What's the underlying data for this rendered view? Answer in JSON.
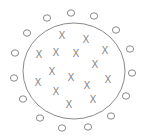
{
  "diagram": {
    "type": "classification-boundary",
    "colors": {
      "stroke": "#8a8a8a",
      "background": "#ffffff"
    },
    "boundary": {
      "shape": "circle",
      "cx": 74,
      "cy": 71,
      "rx": 51,
      "ry": 48
    },
    "inside_marker": "X",
    "outside_marker": "O",
    "x_points": [
      [
        62,
        35
      ],
      [
        86,
        39
      ],
      [
        105,
        50
      ],
      [
        39,
        54
      ],
      [
        56,
        52
      ],
      [
        76,
        53
      ],
      [
        95,
        64
      ],
      [
        52,
        71
      ],
      [
        71,
        77
      ],
      [
        38,
        82
      ],
      [
        87,
        85
      ],
      [
        108,
        79
      ],
      [
        56,
        91
      ],
      [
        93,
        99
      ],
      [
        69,
        104
      ]
    ],
    "o_points": [
      [
        71,
        13
      ],
      [
        94,
        16
      ],
      [
        47,
        18
      ],
      [
        116,
        30
      ],
      [
        27,
        33
      ],
      [
        130,
        49
      ],
      [
        15,
        53
      ],
      [
        132,
        73
      ],
      [
        14,
        78
      ],
      [
        126,
        96
      ],
      [
        23,
        99
      ],
      [
        111,
        116
      ],
      [
        40,
        118
      ],
      [
        88,
        127
      ],
      [
        62,
        128
      ]
    ]
  }
}
